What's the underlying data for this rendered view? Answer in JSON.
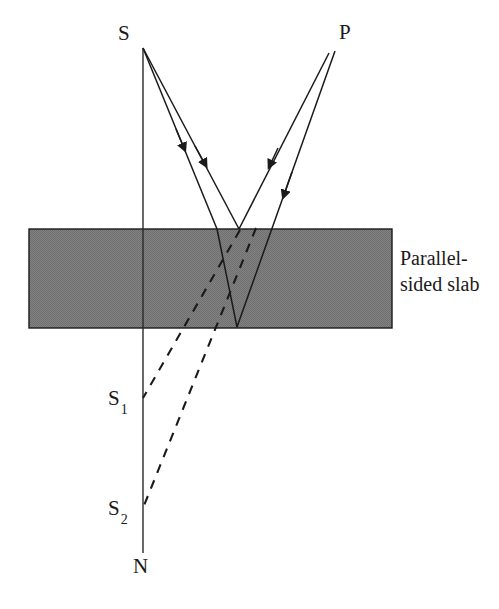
{
  "figure": {
    "type": "optics-ray-diagram",
    "background_color": "#ffffff",
    "ink_color": "#1a1a1a"
  },
  "slab": {
    "caption_line_1": "Parallel-",
    "caption_line_2": "sided slab",
    "fill_color": "#808080",
    "border_color": "#1a1a1a",
    "x": 29,
    "y": 229,
    "width": 363,
    "height": 99
  },
  "points": {
    "source": {
      "label": "S",
      "x": 143,
      "y": 48,
      "label_x": 118,
      "label_y": 23
    },
    "observer": {
      "label": "P",
      "x": 334,
      "y": 50,
      "label_x": 339,
      "label_y": 23
    },
    "image1": {
      "label": "S",
      "subscript": "1",
      "x": 143,
      "y": 398,
      "label_x": 110,
      "label_y": 390
    },
    "image2": {
      "label": "S",
      "subscript": "2",
      "x": 143,
      "y": 508,
      "label_x": 110,
      "label_y": 500
    },
    "normal_end": {
      "label": "N",
      "x": 143,
      "y": 553,
      "label_x": 134,
      "label_y": 557
    }
  },
  "normal_line": {
    "name": "vertical-normal-line",
    "x1": 143,
    "y1": 48,
    "x2": 143,
    "y2": 553
  },
  "rays": [
    {
      "name": "incident-ray-outer",
      "style": "solid",
      "from": "S",
      "points": [
        [
          143,
          48
        ],
        [
          238,
          228
        ]
      ],
      "arrow_at": 0.62
    },
    {
      "name": "incident-ray-inner",
      "style": "solid",
      "from": "S",
      "points": [
        [
          143,
          48
        ],
        [
          216,
          228
        ]
      ],
      "arrow_at": 0.55
    },
    {
      "name": "refracted-ray-in-slab",
      "style": "solid",
      "points": [
        [
          216,
          228
        ],
        [
          237,
          327
        ]
      ]
    },
    {
      "name": "emergent-ray-inner",
      "style": "solid",
      "points": [
        [
          237,
          327
        ],
        [
          334,
          50
        ]
      ],
      "arrow_at": 0.62
    },
    {
      "name": "reflected-ray-outer",
      "style": "solid",
      "points": [
        [
          238,
          228
        ],
        [
          325,
          54
        ]
      ],
      "arrow_at": 0.6
    }
  ],
  "virtual_rays": [
    {
      "name": "virtual-ray-to-S1",
      "style": "dashed",
      "points": [
        [
          238,
          228
        ],
        [
          143,
          398
        ]
      ]
    },
    {
      "name": "virtual-ray-to-S2",
      "style": "dashed",
      "points": [
        [
          253,
          228
        ],
        [
          143,
          508
        ]
      ]
    }
  ]
}
